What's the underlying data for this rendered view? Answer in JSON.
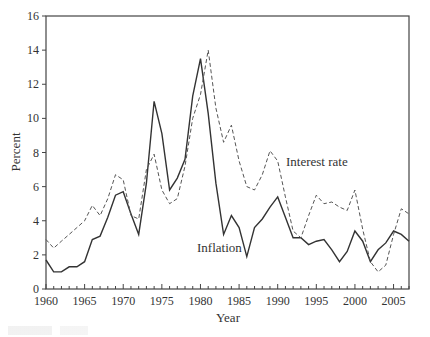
{
  "chart_data": {
    "type": "line",
    "title": "",
    "xlabel": "Year",
    "ylabel": "Percent",
    "xlim": [
      1960,
      2007
    ],
    "ylim": [
      0,
      16
    ],
    "grid": false,
    "legend_position": "inline labels",
    "x_ticks_major": [
      1960,
      1965,
      1970,
      1975,
      1980,
      1985,
      1990,
      1995,
      2000,
      2005
    ],
    "x_tick_labels": [
      "1960",
      "1965",
      "1970",
      "1975",
      "1980",
      "1985",
      "1990",
      "1995",
      "2000",
      "2005"
    ],
    "y_ticks": [
      0,
      2,
      4,
      6,
      8,
      10,
      12,
      14,
      16
    ],
    "y_tick_labels": [
      "0",
      "2",
      "4",
      "6",
      "8",
      "10",
      "12",
      "14",
      "16"
    ],
    "x": [
      1960,
      1961,
      1962,
      1963,
      1964,
      1965,
      1966,
      1967,
      1968,
      1969,
      1970,
      1971,
      1972,
      1973,
      1974,
      1975,
      1976,
      1977,
      1978,
      1979,
      1980,
      1981,
      1982,
      1983,
      1984,
      1985,
      1986,
      1987,
      1988,
      1989,
      1990,
      1991,
      1992,
      1993,
      1994,
      1995,
      1996,
      1997,
      1998,
      1999,
      2000,
      2001,
      2002,
      2003,
      2004,
      2005,
      2006,
      2007
    ],
    "series": [
      {
        "name": "Inflation",
        "style": "solid",
        "color": "#333333",
        "values": [
          1.7,
          1.0,
          1.0,
          1.3,
          1.3,
          1.6,
          2.9,
          3.1,
          4.2,
          5.5,
          5.7,
          4.4,
          3.2,
          6.2,
          11.0,
          9.1,
          5.8,
          6.5,
          7.6,
          11.3,
          13.5,
          10.3,
          6.2,
          3.2,
          4.3,
          3.6,
          1.9,
          3.6,
          4.1,
          4.8,
          5.4,
          4.2,
          3.0,
          3.0,
          2.6,
          2.8,
          2.9,
          2.3,
          1.6,
          2.2,
          3.4,
          2.8,
          1.6,
          2.3,
          2.7,
          3.4,
          3.2,
          2.8
        ]
      },
      {
        "name": "Interest rate",
        "style": "dashed",
        "color": "#555555",
        "values": [
          2.9,
          2.4,
          2.8,
          3.2,
          3.6,
          4.0,
          4.9,
          4.3,
          5.3,
          6.7,
          6.4,
          4.3,
          4.1,
          7.0,
          7.9,
          5.8,
          5.0,
          5.3,
          7.2,
          10.0,
          11.4,
          14.0,
          10.6,
          8.6,
          9.6,
          7.5,
          6.0,
          5.8,
          6.7,
          8.1,
          7.5,
          5.4,
          3.4,
          3.0,
          4.3,
          5.5,
          5.0,
          5.1,
          4.8,
          4.6,
          5.8,
          3.5,
          1.6,
          1.0,
          1.4,
          3.2,
          4.7,
          4.4
        ]
      }
    ],
    "annotations": [
      {
        "text": "Interest rate",
        "x": 1991.5,
        "y": 7.6,
        "series": "Interest rate"
      },
      {
        "text": "Inflation",
        "x": 1986.5,
        "y": 2.8,
        "series": "Inflation"
      }
    ]
  },
  "labels": {
    "xlabel": "Year",
    "ylabel": "Percent",
    "interest_label": "Interest rate",
    "inflation_label": "Inflation"
  }
}
